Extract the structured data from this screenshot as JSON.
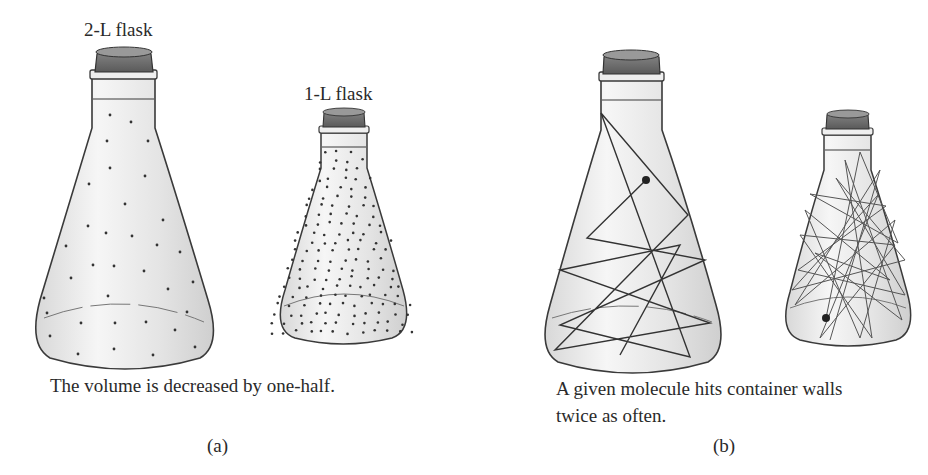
{
  "panels": [
    {
      "id": "a",
      "panel_label": "(a)",
      "caption": "The volume is decreased by one-half.",
      "flasks": [
        {
          "label": "2-L flask",
          "volume_liters": 2,
          "content": "sparse dots (molecules)"
        },
        {
          "label": "1-L flask",
          "volume_liters": 1,
          "content": "dense dots (molecules)"
        }
      ]
    },
    {
      "id": "b",
      "panel_label": "(b)",
      "caption_line1": "A given molecule hits container walls",
      "caption_line2": "twice as often.",
      "flasks": [
        {
          "label": "",
          "content": "molecule path with few wall collisions"
        },
        {
          "label": "",
          "content": "molecule path with twice as many wall collisions"
        }
      ]
    }
  ],
  "colors": {
    "outline": "#3a3a3a",
    "glass": "#e6e6e6",
    "cork": "#6a6a6a",
    "dot": "#333333",
    "path": "#444444"
  }
}
